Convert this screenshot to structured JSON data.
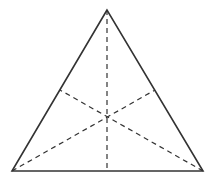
{
  "diagram": {
    "type": "triangle-medians",
    "colors": {
      "stroke": "#333333",
      "background": "#ffffff"
    },
    "vertices": {
      "apex": [
        107,
        10
      ],
      "bottom_left": [
        12,
        171
      ],
      "bottom_right": [
        203,
        171
      ]
    },
    "midpoints": {
      "left_side": [
        60,
        90
      ],
      "right_side": [
        155,
        90
      ],
      "base": [
        107,
        171
      ]
    },
    "centroid": [
      107,
      116
    ]
  }
}
